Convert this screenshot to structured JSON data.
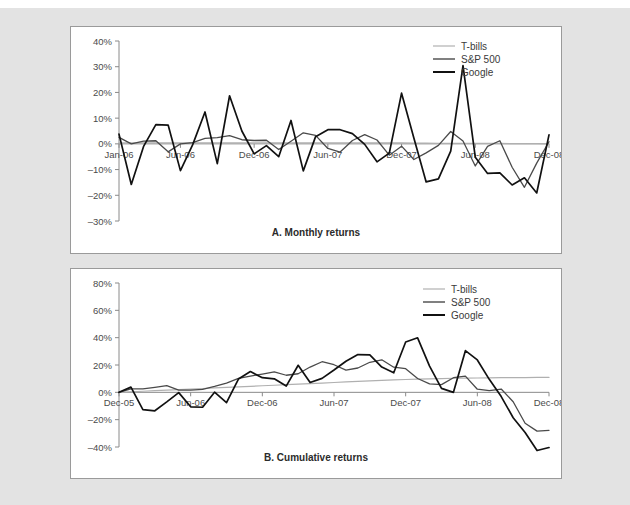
{
  "figure": {
    "background_color": "#e3e3e3",
    "panel_color": "#ffffff",
    "panel_border_color": "#9a9a9a"
  },
  "series_colors": {
    "tbills": "#b0b0b0",
    "sp500": "#5a5a5a",
    "google": "#1a1a1a"
  },
  "legend": {
    "items": [
      {
        "label": "T-bills",
        "color": "#b0b0b0",
        "width": 1.2
      },
      {
        "label": "S&P 500",
        "color": "#4a4a4a",
        "width": 1.4
      },
      {
        "label": "Google",
        "color": "#111111",
        "width": 2.0
      }
    ]
  },
  "chart_data": [
    {
      "id": "panel-a",
      "type": "line",
      "title": "A.  Monthly returns",
      "xlabel": "",
      "ylabel": "",
      "ylim": [
        -30,
        40
      ],
      "yticks": [
        40,
        30,
        20,
        10,
        0,
        -10,
        -20,
        -30
      ],
      "ytick_labels": [
        "40%",
        "30%",
        "20%",
        "10%",
        "0%",
        "–10%",
        "–20%",
        "–30%"
      ],
      "xticks": [
        0,
        5,
        11,
        17,
        23,
        29,
        35
      ],
      "xtick_labels": [
        "Jan-06",
        "Jun-06",
        "Dec-06",
        "Jun-07",
        "Dec-07",
        "Jun-08",
        "Dec-08"
      ],
      "grid": false,
      "zero_line": true,
      "legend_position": "top-right",
      "n_points": 36,
      "series": [
        {
          "name": "T-bills",
          "color": "#b0b0b0",
          "values": [
            0.4,
            0.4,
            0.4,
            0.4,
            0.4,
            0.4,
            0.4,
            0.4,
            0.4,
            0.4,
            0.4,
            0.4,
            0.4,
            0.4,
            0.4,
            0.4,
            0.4,
            0.4,
            0.4,
            0.4,
            0.4,
            0.4,
            0.35,
            0.35,
            0.3,
            0.25,
            0.2,
            0.15,
            0.15,
            0.15,
            0.15,
            0.15,
            0.1,
            0.1,
            0.05,
            0.0
          ]
        },
        {
          "name": "S&P 500",
          "color": "#4a4a4a",
          "values": [
            2.5,
            0.0,
            1.1,
            1.2,
            -3.1,
            0.0,
            0.5,
            2.1,
            2.4,
            3.2,
            1.6,
            1.3,
            1.4,
            -2.2,
            1.0,
            4.3,
            3.3,
            -1.8,
            -3.2,
            1.3,
            3.6,
            1.5,
            -4.4,
            -0.9,
            -6.1,
            -3.5,
            -0.6,
            4.8,
            1.1,
            -8.6,
            -1.0,
            1.2,
            -9.1,
            -16.9,
            -7.5,
            0.8
          ]
        },
        {
          "name": "Google",
          "color": "#111111",
          "values": [
            3.8,
            -15.8,
            -1.0,
            7.5,
            7.3,
            -10.4,
            -0.3,
            12.4,
            -7.7,
            18.7,
            5.0,
            -3.9,
            -0.7,
            -5.0,
            9.1,
            -10.5,
            2.8,
            5.5,
            5.5,
            4.0,
            -0.2,
            -7.0,
            -3.6,
            19.7,
            2.3,
            -14.8,
            -13.6,
            -2.8,
            30.4,
            -5.2,
            -11.5,
            -11.3,
            -16.0,
            -13.2,
            -19.1,
            3.5
          ]
        }
      ]
    },
    {
      "id": "panel-b",
      "type": "line",
      "title": "B.  Cumulative returns",
      "xlabel": "",
      "ylabel": "",
      "ylim": [
        -40,
        80
      ],
      "yticks": [
        80,
        60,
        40,
        20,
        0,
        -20,
        -40
      ],
      "ytick_labels": [
        "80%",
        "60%",
        "40%",
        "20%",
        "0%",
        "–20%",
        "–40%"
      ],
      "xticks": [
        0,
        6,
        12,
        18,
        24,
        30,
        36
      ],
      "xtick_labels": [
        "Dec-05",
        "Jun-06",
        "Dec-06",
        "Jun-07",
        "Dec-07",
        "Jun-08",
        "Dec-08"
      ],
      "grid": false,
      "zero_line": true,
      "legend_position": "top-right",
      "n_points": 37,
      "series": [
        {
          "name": "T-bills",
          "color": "#b0b0b0",
          "values": [
            0.0,
            0.4,
            0.8,
            1.2,
            1.6,
            2.0,
            2.4,
            2.8,
            3.2,
            3.6,
            4.0,
            4.4,
            4.8,
            5.2,
            5.6,
            6.0,
            6.4,
            6.8,
            7.2,
            7.6,
            8.0,
            8.4,
            8.8,
            9.1,
            9.4,
            9.7,
            9.9,
            10.1,
            10.3,
            10.4,
            10.5,
            10.6,
            10.7,
            10.8,
            10.8,
            10.9,
            10.9
          ]
        },
        {
          "name": "S&P 500",
          "color": "#4a4a4a",
          "values": [
            0.0,
            2.5,
            2.5,
            3.6,
            4.9,
            1.6,
            1.6,
            2.1,
            4.3,
            6.8,
            10.2,
            11.9,
            13.4,
            15.0,
            12.5,
            13.6,
            18.5,
            22.4,
            20.2,
            16.3,
            17.8,
            22.0,
            23.8,
            18.4,
            17.3,
            10.1,
            6.2,
            5.6,
            10.7,
            11.9,
            2.3,
            1.2,
            2.4,
            -6.9,
            -22.6,
            -28.4,
            -27.8
          ]
        },
        {
          "name": "Google",
          "color": "#111111",
          "values": [
            0.0,
            3.8,
            -12.6,
            -13.5,
            -7.0,
            -0.2,
            -10.6,
            -10.9,
            0.1,
            -7.6,
            9.7,
            15.2,
            10.7,
            9.9,
            4.6,
            19.8,
            7.2,
            10.2,
            16.3,
            22.7,
            27.6,
            27.4,
            18.5,
            14.3,
            36.8,
            39.9,
            19.2,
            2.9,
            0.0,
            30.5,
            23.7,
            9.5,
            -3.1,
            -18.6,
            -29.4,
            -42.6,
            -40.4
          ]
        }
      ]
    }
  ]
}
